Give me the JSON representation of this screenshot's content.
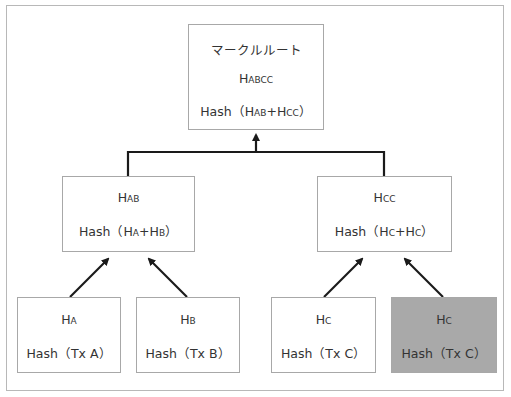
{
  "diagram": {
    "type": "merkle-tree",
    "root": {
      "title": "マークルルート",
      "hash_main": "H",
      "hash_sub": "ABCC",
      "formula_prefix": "Hash（",
      "formula_a_main": "H",
      "formula_a_sub": "AB",
      "formula_plus": "+",
      "formula_b_main": "H",
      "formula_b_sub": "CC",
      "formula_suffix": "）"
    },
    "level1": [
      {
        "hash_main": "H",
        "hash_sub": "AB",
        "formula_prefix": "Hash（",
        "a_main": "H",
        "a_sub": "A",
        "plus": "+",
        "b_main": "H",
        "b_sub": "B",
        "formula_suffix": "）"
      },
      {
        "hash_main": "H",
        "hash_sub": "CC",
        "formula_prefix": "Hash（",
        "a_main": "H",
        "a_sub": "C",
        "plus": "+",
        "b_main": "H",
        "b_sub": "C",
        "formula_suffix": "）"
      }
    ],
    "leaves": [
      {
        "hash_main": "H",
        "hash_sub": "A",
        "formula": "Hash（Tx A）",
        "shaded": false
      },
      {
        "hash_main": "H",
        "hash_sub": "B",
        "formula": "Hash（Tx B）",
        "shaded": false
      },
      {
        "hash_main": "H",
        "hash_sub": "C",
        "formula": "Hash（Tx C）",
        "shaded": false
      },
      {
        "hash_main": "H",
        "hash_sub": "C",
        "formula": "Hash（Tx C）",
        "shaded": true
      }
    ],
    "colors": {
      "box_border": "#a8a8a8",
      "shaded_fill": "#a9a9a9",
      "connector": "#1a1a1a",
      "text": "#333333"
    }
  }
}
